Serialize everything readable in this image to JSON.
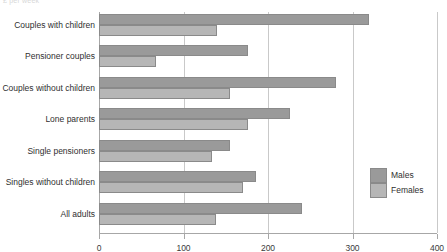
{
  "top_caption": "£ per week",
  "legend": {
    "position": "right",
    "entries": [
      {
        "label": "Males",
        "color": "#9a9a9a"
      },
      {
        "label": "Females",
        "color": "#b6b6b6"
      }
    ]
  },
  "axis": {
    "x_ticks": [
      "0",
      "100",
      "200",
      "300",
      "400"
    ],
    "x_min": 0,
    "x_max": 400
  },
  "chart_data": {
    "type": "bar",
    "orientation": "horizontal",
    "title": "",
    "subtitle": "",
    "xlabel": "",
    "ylabel": "",
    "xlim": [
      0,
      400
    ],
    "xticks": [
      0,
      100,
      200,
      300,
      400
    ],
    "grid": true,
    "legend_position": "right",
    "categories": [
      "Couples with children",
      "Pensioner couples",
      "Couples without children",
      "Lone parents",
      "Single pensioners",
      "Singles without children",
      "All adults"
    ],
    "series": [
      {
        "name": "Males",
        "color": "#9a9a9a",
        "values": [
          320,
          176,
          281,
          226,
          155,
          186,
          240
        ]
      },
      {
        "name": "Females",
        "color": "#b6b6b6",
        "values": [
          140,
          67,
          155,
          176,
          134,
          170,
          139
        ]
      }
    ]
  }
}
